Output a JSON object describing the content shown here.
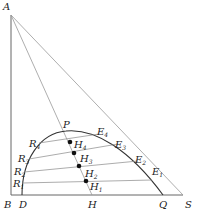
{
  "diagram": {
    "type": "ternary phase diagram (right triangle) with binodal curve and tie lines",
    "points": {
      "A": {
        "label": "A",
        "x": 11,
        "y": 15
      },
      "B": {
        "label": "B",
        "x": 11,
        "y": 195
      },
      "S": {
        "label": "S",
        "x": 183,
        "y": 195
      },
      "D": {
        "label": "D",
        "x": 22,
        "y": 195
      },
      "H": {
        "label": "H",
        "x": 92,
        "y": 195
      },
      "Q": {
        "label": "Q",
        "x": 163,
        "y": 195
      },
      "P": {
        "label": "P",
        "x": 66,
        "y": 132
      }
    },
    "raffinate_points": [
      {
        "label": "R",
        "sub": "1",
        "x": 22,
        "y": 183
      },
      {
        "label": "R",
        "sub": "2",
        "x": 24,
        "y": 172
      },
      {
        "label": "R",
        "sub": "3",
        "x": 29,
        "y": 159
      },
      {
        "label": "R",
        "sub": "4",
        "x": 39,
        "y": 143
      }
    ],
    "extract_points": [
      {
        "label": "E",
        "sub": "1",
        "x": 152,
        "y": 180
      },
      {
        "label": "E",
        "sub": "2",
        "x": 138,
        "y": 161
      },
      {
        "label": "E",
        "sub": "3",
        "x": 118,
        "y": 144
      },
      {
        "label": "E",
        "sub": "4",
        "x": 99,
        "y": 134
      }
    ],
    "mixture_points": [
      {
        "label": "H",
        "sub": "1",
        "x": 86,
        "y": 181
      },
      {
        "label": "H",
        "sub": "2",
        "x": 79,
        "y": 167
      },
      {
        "label": "H",
        "sub": "3",
        "x": 74,
        "y": 153
      },
      {
        "label": "H",
        "sub": "4",
        "x": 70,
        "y": 142
      }
    ],
    "colors": {
      "line": "#888888",
      "curve": "#333333",
      "dot": "#111111",
      "text": "#222222"
    }
  }
}
